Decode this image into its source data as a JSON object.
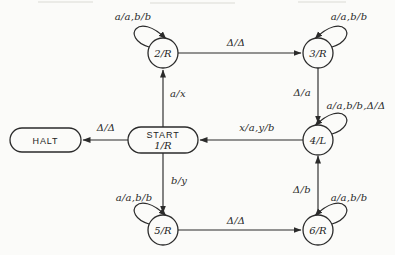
{
  "colors": {
    "background": "#fbfbf9",
    "ink": "#2b2b2b"
  },
  "diagram": {
    "type": "turing-machine-state-diagram",
    "states": [
      {
        "id": "2",
        "label": "2/R",
        "shape": "circle",
        "self_loop": "a/a,b/b"
      },
      {
        "id": "3",
        "label": "3/R",
        "shape": "circle",
        "self_loop": "a/a,b/b"
      },
      {
        "id": "4",
        "label": "4/L",
        "shape": "circle",
        "self_loop": "a/a,b/b,Δ/Δ"
      },
      {
        "id": "5",
        "label": "5/R",
        "shape": "circle",
        "self_loop": "a/a,b/b"
      },
      {
        "id": "6",
        "label": "6/R",
        "shape": "circle",
        "self_loop": "a/a,b/b"
      },
      {
        "id": "start",
        "label_line1": "START",
        "label_line2": "1/R",
        "shape": "stadium"
      },
      {
        "id": "halt",
        "label": "HALT",
        "shape": "stadium"
      }
    ],
    "transitions": [
      {
        "from": "2",
        "to": "3",
        "label": "Δ/Δ"
      },
      {
        "from": "3",
        "to": "4",
        "label": "Δ/a"
      },
      {
        "from": "4",
        "to": "start",
        "label": "x/a,y/b"
      },
      {
        "from": "start",
        "to": "halt",
        "label": "Δ/Δ"
      },
      {
        "from": "start",
        "to": "2",
        "label": "a/x"
      },
      {
        "from": "start",
        "to": "5",
        "label": "b/y"
      },
      {
        "from": "5",
        "to": "6",
        "label": "Δ/Δ"
      },
      {
        "from": "6",
        "to": "4",
        "label": "Δ/b"
      }
    ]
  }
}
